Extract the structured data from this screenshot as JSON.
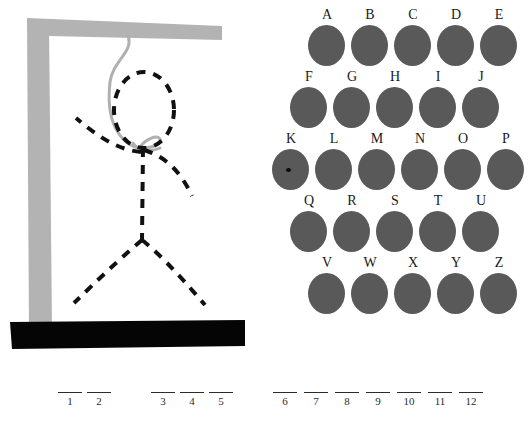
{
  "game": {
    "title": "Hangman",
    "figure_state": "complete",
    "wrong_guesses": 6
  },
  "colors": {
    "gallows": "#b3b3b3",
    "base": "#050505",
    "rope": "#b0b0b0",
    "figure": "#111111",
    "letter_disc": "#595959",
    "letter_label": "#1a1a1a",
    "blank_line": "#2b2b2b",
    "cursor_dot": "#0a0a0a",
    "background": "#ffffff"
  },
  "gallows": {
    "post_name": "gallows-post",
    "beam_name": "gallows-beam",
    "base_name": "gallows-base",
    "rope_name": "hangman-rope"
  },
  "figure": {
    "head": "dashed-ellipse-head",
    "body": "dashed-torso",
    "left_arm": "dashed-left-arm",
    "right_arm": "dashed-right-arm",
    "left_leg": "dashed-left-leg",
    "right_leg": "dashed-right-leg"
  },
  "alphabet": {
    "rows": [
      {
        "offset": 18,
        "letters": [
          {
            "label": "A",
            "selected": false
          },
          {
            "label": "B",
            "selected": false
          },
          {
            "label": "C",
            "selected": false
          },
          {
            "label": "D",
            "selected": false
          },
          {
            "label": "E",
            "selected": false
          }
        ]
      },
      {
        "offset": 0,
        "letters": [
          {
            "label": "F",
            "selected": false
          },
          {
            "label": "G",
            "selected": false
          },
          {
            "label": "H",
            "selected": false
          },
          {
            "label": "I",
            "selected": false
          },
          {
            "label": "J",
            "selected": false
          }
        ]
      },
      {
        "offset": -18,
        "letters": [
          {
            "label": "K",
            "selected": true
          },
          {
            "label": "L",
            "selected": false
          },
          {
            "label": "M",
            "selected": false
          },
          {
            "label": "N",
            "selected": false
          },
          {
            "label": "O",
            "selected": false
          },
          {
            "label": "P",
            "selected": false
          }
        ]
      },
      {
        "offset": 0,
        "letters": [
          {
            "label": "Q",
            "selected": false
          },
          {
            "label": "R",
            "selected": false
          },
          {
            "label": "S",
            "selected": false
          },
          {
            "label": "T",
            "selected": false
          },
          {
            "label": "U",
            "selected": false
          }
        ]
      },
      {
        "offset": 18,
        "letters": [
          {
            "label": "V",
            "selected": false
          },
          {
            "label": "W",
            "selected": false
          },
          {
            "label": "X",
            "selected": false
          },
          {
            "label": "Y",
            "selected": false
          },
          {
            "label": "Z",
            "selected": false
          }
        ]
      }
    ]
  },
  "blanks": {
    "slots": [
      {
        "number": "1",
        "x": 58,
        "letter": ""
      },
      {
        "number": "2",
        "x": 87,
        "letter": ""
      },
      {
        "number": "3",
        "x": 151,
        "letter": ""
      },
      {
        "number": "4",
        "x": 180,
        "letter": ""
      },
      {
        "number": "5",
        "x": 209,
        "letter": ""
      },
      {
        "number": "6",
        "x": 273,
        "letter": ""
      },
      {
        "number": "7",
        "x": 304,
        "letter": ""
      },
      {
        "number": "8",
        "x": 335,
        "letter": ""
      },
      {
        "number": "9",
        "x": 366,
        "letter": ""
      },
      {
        "number": "10",
        "x": 397,
        "letter": ""
      },
      {
        "number": "11",
        "x": 428,
        "letter": ""
      },
      {
        "number": "12",
        "x": 459,
        "letter": ""
      }
    ]
  }
}
